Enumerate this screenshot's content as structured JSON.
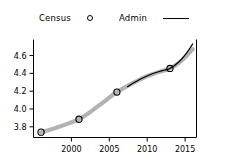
{
  "chart_data": {
    "type": "line",
    "title": "",
    "xlabel": "",
    "ylabel": "",
    "xlim": [
      1995,
      2016.5
    ],
    "ylim": [
      3.68,
      4.78
    ],
    "grid": false,
    "legend_position": "top-center",
    "xticks": [
      2000,
      2005,
      2010,
      2015
    ],
    "yticks": [
      3.8,
      4.0,
      4.2,
      4.4,
      4.6
    ],
    "ytick_labels": [
      "3.8",
      "4.0",
      "4.2",
      "4.4",
      "4.6"
    ],
    "xtick_labels": [
      "2000",
      "2005",
      "2010",
      "2015"
    ],
    "series": [
      {
        "name": "Census",
        "style": "thick-grey-line-with-open-circle-markers",
        "color": "#b3b3b3",
        "marker": "open-circle",
        "marker_color": "#000000",
        "x": [
          1996,
          1998,
          2001,
          2003.5,
          2006,
          2009,
          2011,
          2013,
          2014.5,
          2016
        ],
        "y": [
          3.74,
          3.79,
          3.885,
          4.03,
          4.19,
          4.33,
          4.4,
          4.455,
          4.54,
          4.67
        ],
        "marker_points": {
          "x": [
            1996,
            2001,
            2006,
            2013
          ],
          "y": [
            3.74,
            3.885,
            4.19,
            4.455
          ]
        }
      },
      {
        "name": "Admin",
        "style": "thin-black-line",
        "color": "#000000",
        "marker": "none",
        "x": [
          2007.4,
          2009,
          2010.5,
          2012,
          2013,
          2014.2,
          2015.2,
          2016
        ],
        "y": [
          4.25,
          4.33,
          4.39,
          4.43,
          4.455,
          4.53,
          4.63,
          4.73
        ]
      }
    ]
  },
  "legend": {
    "entries": [
      {
        "label": "Census",
        "marker": "circle-marker-icon"
      },
      {
        "label": "Admin",
        "marker": "line-marker-icon"
      }
    ]
  }
}
